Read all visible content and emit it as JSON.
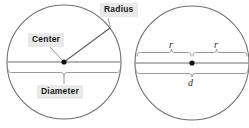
{
  "figure": {
    "caption_labels": [
      "Radius",
      "Center",
      "Diameter"
    ],
    "stroke_color": "#6e6e6e",
    "label_bg_color": "#e9e9e9",
    "label_text_color": "#1a1a1a",
    "background_color": "#ffffff"
  },
  "left_circle": {
    "name": "labeled-circle",
    "radius_label": "Radius",
    "center_label": "Center",
    "diameter_label": "Diameter"
  },
  "right_circle": {
    "name": "radius-diameter-circle",
    "radius_left_symbol": "r",
    "radius_right_symbol": "r",
    "diameter_symbol": "d"
  }
}
